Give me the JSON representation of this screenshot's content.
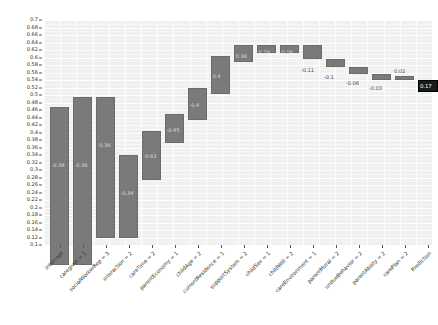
{
  "chart_data": {
    "type": "bar",
    "subtype": "waterfall",
    "title": "",
    "xlabel": "",
    "ylabel": "",
    "ylim": [
      0.1,
      0.7
    ],
    "ytick_step": 0.02,
    "grid": true,
    "legend": null,
    "baseline_value": 0.5,
    "categories": [
      "intercept",
      "caregiver = 1",
      "socialWorkerRep = 3",
      "interaction = 2",
      "careTime = 2",
      "parentEconomy = 1",
      "childAge = 2",
      "currentResidence = 1",
      "supportSystem = 2",
      "childSex = 1",
      "childWill = 2",
      "careEnvironment = 1",
      "parentMoral = 2",
      "undueBehavior = 2",
      "parentAbility = 2",
      "carePlan = 2",
      "Prediction"
    ],
    "values": [
      -0.38,
      -0.36,
      -0.36,
      -0.34,
      -0.63,
      -0.45,
      -0.4,
      0.4,
      0.38,
      0.19,
      0.16,
      -0.11,
      -0.1,
      -0.06,
      -0.03,
      0.02,
      0.17
    ],
    "value_labels": [
      "-0.38",
      "-0.36",
      "-0.36",
      "-0.34",
      "-0.63",
      "-0.45",
      "-0.4",
      "0.4",
      "0.38",
      "0.19",
      "0.16",
      "-0.11",
      "-0.1",
      "-0.06",
      "-0.03",
      "0.02",
      "0.17"
    ],
    "ytick_labels": [
      "0.7",
      "0.68",
      "0.66",
      "0.64",
      "0.62",
      "0.6",
      "0.58",
      "0.56",
      "0.54",
      "0.52",
      "0.5",
      "0.48",
      "0.46",
      "0.44",
      "0.42",
      "0.4",
      "0.38",
      "0.36",
      "0.34",
      "0.32",
      "0.3",
      "0.28",
      "0.26",
      "0.24",
      "0.22",
      "0.2",
      "0.18",
      "0.16",
      "0.14",
      "0.12",
      "0.1"
    ],
    "ytick_values": [
      0.7,
      0.68,
      0.66,
      0.64,
      0.62,
      0.6,
      0.58,
      0.56,
      0.54,
      0.52,
      0.5,
      0.48,
      0.46,
      0.44,
      0.42,
      0.4,
      0.38,
      0.36,
      0.34,
      0.32,
      0.3,
      0.28,
      0.26,
      0.24,
      0.22,
      0.2,
      0.18,
      0.16,
      0.14,
      0.12,
      0.1
    ],
    "bar_geometry": [
      {
        "label": "intercept",
        "x": 6,
        "w": 19,
        "top": 86.5,
        "bottom": 245,
        "value_label": "-0.38",
        "label_x": 7.5,
        "label_y": 142,
        "label_inside": true,
        "final": false
      },
      {
        "label": "caregiver = 1",
        "x": 29,
        "w": 19,
        "top": 77,
        "bottom": 245,
        "value_label": "-0.36",
        "label_x": 30.5,
        "label_y": 142,
        "label_inside": true,
        "final": false
      },
      {
        "label": "socialWorkerRep = 3",
        "x": 52,
        "w": 19,
        "top": 77,
        "bottom": 218,
        "value_label": "-0.36",
        "label_x": 53.5,
        "label_y": 122,
        "label_inside": true,
        "final": false
      },
      {
        "label": "interaction = 2",
        "x": 75,
        "w": 19,
        "top": 135,
        "bottom": 218,
        "value_label": "-0.34",
        "label_x": 76.5,
        "label_y": 170,
        "label_inside": true,
        "final": false
      },
      {
        "label": "careTime = 2",
        "x": 98,
        "w": 19,
        "top": 111,
        "bottom": 160,
        "value_label": "-0.63",
        "label_x": 99.5,
        "label_y": 133,
        "label_inside": true,
        "final": false
      },
      {
        "label": "parentEconomy = 1",
        "x": 121,
        "w": 19,
        "top": 94,
        "bottom": 123,
        "value_label": "-0.45",
        "label_x": 122.5,
        "label_y": 107,
        "label_inside": true,
        "final": false
      },
      {
        "label": "childAge = 2",
        "x": 144,
        "w": 19,
        "top": 68,
        "bottom": 100,
        "value_label": "-0.4",
        "label_x": 145.5,
        "label_y": 82,
        "label_inside": true,
        "final": false
      },
      {
        "label": "currentResidence = 1",
        "x": 167,
        "w": 19,
        "top": 36,
        "bottom": 74,
        "value_label": "0.4",
        "label_x": 168.5,
        "label_y": 53,
        "label_inside": true,
        "final": false
      },
      {
        "label": "supportSystem = 2",
        "x": 190,
        "w": 19,
        "top": 25,
        "bottom": 42,
        "value_label": "0.38",
        "label_x": 191.5,
        "label_y": 33,
        "label_inside": true,
        "final": false
      },
      {
        "label": "childSex = 1",
        "x": 213,
        "w": 19,
        "top": 25,
        "bottom": 33,
        "value_label": "0.19",
        "label_x": 214.5,
        "label_y": 29,
        "label_inside": true,
        "final": false
      },
      {
        "label": "childWill = 2",
        "x": 236,
        "w": 19,
        "top": 25,
        "bottom": 33,
        "value_label": "0.16",
        "label_x": 237.5,
        "label_y": 29,
        "label_inside": true,
        "final": false
      },
      {
        "label": "careEnvironment = 1",
        "x": 259,
        "w": 19,
        "top": 25,
        "bottom": 39,
        "value_label": "-0.11",
        "label_x": 257,
        "label_y": 47,
        "label_inside": false,
        "final": false
      },
      {
        "label": "parentMoral = 2",
        "x": 282,
        "w": 19,
        "top": 39,
        "bottom": 47,
        "value_label": "-0.1",
        "label_x": 280,
        "label_y": 54,
        "label_inside": false,
        "final": false
      },
      {
        "label": "undueBehavior = 2",
        "x": 305,
        "w": 19,
        "top": 47,
        "bottom": 54,
        "value_label": "-0.06",
        "label_x": 302,
        "label_y": 60,
        "label_inside": false,
        "final": false
      },
      {
        "label": "parentAbility = 2",
        "x": 328,
        "w": 19,
        "top": 54,
        "bottom": 60,
        "value_label": "-0.03",
        "label_x": 325,
        "label_y": 65,
        "label_inside": false,
        "final": false
      },
      {
        "label": "carePlan = 2",
        "x": 351,
        "w": 19,
        "top": 56,
        "bottom": 60,
        "value_label": "0.02",
        "label_x": 350,
        "label_y": 48,
        "label_inside": false,
        "final": false
      },
      {
        "label": "Prediction",
        "x": 374,
        "w": 20,
        "top": 60,
        "bottom": 72,
        "value_label": "0.17",
        "label_x": 376,
        "label_y": 63,
        "label_inside": true,
        "final": true
      }
    ]
  },
  "colors": {
    "bar_fill": "#7a7a7a",
    "bar_stroke": "#6b6b6b",
    "final_bar_fill": "#1b1b1b",
    "plot_background": "#f0f0f0",
    "grid": "#ffffff",
    "zero_line": "#6e6e6e",
    "text": "#333333"
  }
}
